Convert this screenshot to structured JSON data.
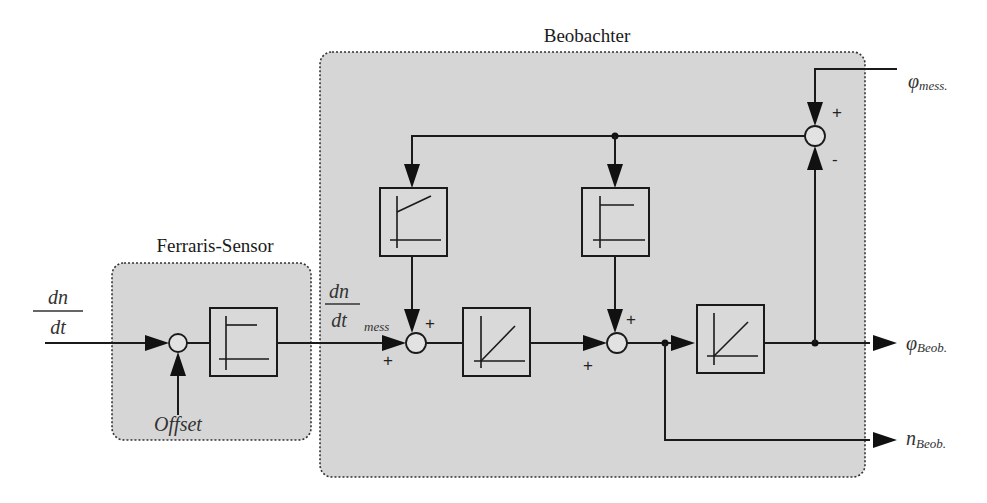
{
  "diagram": {
    "groups": {
      "observer": {
        "title": "Beobachter"
      },
      "sensor": {
        "title": "Ferraris-Sensor"
      }
    },
    "signals": {
      "input": {
        "numerator": "dn",
        "denominator": "dt"
      },
      "measured_accel": {
        "numerator": "dn",
        "denominator": "dt",
        "subscript": "mess"
      },
      "offset": "Offset",
      "phi_mess": {
        "symbol": "φ",
        "subscript": "mess."
      },
      "phi_beob": {
        "symbol": "φ",
        "subscript": "Beob."
      },
      "n_beob": {
        "symbol": "n",
        "subscript": "Beob."
      }
    },
    "signs": {
      "sum_observer_1_left": "+",
      "sum_observer_1_top": "+",
      "sum_observer_2_left": "+",
      "sum_observer_2_top": "+",
      "sum_error_top": "+",
      "sum_error_bottom": "-"
    },
    "blocks": [
      {
        "id": "sensor-highpass",
        "type": "step-response-pt1-like"
      },
      {
        "id": "feedback-gain-pi",
        "type": "pi-ramp-with-offset"
      },
      {
        "id": "integrator-1",
        "type": "integrator-ramp"
      },
      {
        "id": "feedback-gain-p",
        "type": "step-response"
      },
      {
        "id": "integrator-2",
        "type": "integrator-ramp"
      }
    ]
  }
}
